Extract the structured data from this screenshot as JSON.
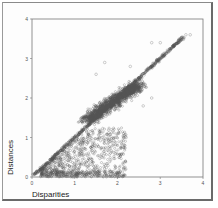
{
  "chart_data": {
    "type": "scatter",
    "title": "",
    "xlabel": "Disparities",
    "ylabel": "Distances",
    "xlim": [
      0,
      4
    ],
    "ylim": [
      0,
      4
    ],
    "x_ticks": [
      "0",
      "1",
      "2",
      "3",
      "4"
    ],
    "y_ticks": [
      "0",
      "1",
      "2",
      "3",
      "4"
    ],
    "grid": false,
    "legend": null,
    "marker": "open-circle",
    "marker_color": "#555555",
    "series": [
      {
        "name": "diagonal band",
        "points_approx": [
          [
            0.1,
            0.1
          ],
          [
            0.5,
            0.5
          ],
          [
            1.0,
            1.0
          ],
          [
            1.5,
            1.5
          ],
          [
            2.0,
            2.0
          ],
          [
            2.5,
            2.5
          ],
          [
            3.0,
            3.0
          ],
          [
            3.3,
            3.3
          ],
          [
            3.5,
            3.5
          ]
        ]
      },
      {
        "name": "dense cluster",
        "center_approx": [
          1.8,
          1.9
        ],
        "x_range": [
          1.2,
          2.5
        ],
        "y_range": [
          1.3,
          2.5
        ]
      },
      {
        "name": "lower scatter",
        "x_range": [
          0.3,
          2.2
        ],
        "y_range": [
          0.0,
          1.2
        ]
      },
      {
        "name": "outliers",
        "points_approx": [
          [
            3.6,
            3.6
          ],
          [
            3.7,
            3.6
          ],
          [
            2.8,
            3.4
          ],
          [
            3.0,
            3.4
          ],
          [
            1.7,
            2.9
          ],
          [
            1.5,
            2.6
          ],
          [
            2.3,
            2.8
          ],
          [
            2.8,
            2.0
          ],
          [
            2.6,
            1.8
          ],
          [
            2.2,
            1.0
          ]
        ]
      }
    ]
  },
  "axes": {
    "xlabel": "Disparities",
    "ylabel": "Distances",
    "x_ticks": [
      "0",
      "1",
      "2",
      "3",
      "4"
    ],
    "y_ticks": [
      "0",
      "1",
      "2",
      "3",
      "4"
    ]
  }
}
